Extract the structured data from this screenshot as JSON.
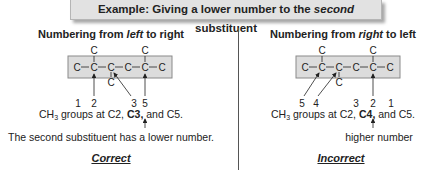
{
  "title": {
    "prefix": "Example: Giving a lower number to the ",
    "emphasis": "second",
    "suffix": " substituent"
  },
  "left": {
    "heading_prefix": "Numbering from ",
    "heading_emphasis": "left",
    "heading_suffix": " to right",
    "chain_atoms": [
      "C",
      "C",
      "C",
      "C",
      "C",
      "C"
    ],
    "substituents_top": [
      "C",
      "C"
    ],
    "substituent_bottom": "C",
    "numbers": [
      "1",
      "2",
      "3",
      "5"
    ],
    "groups_prefix": "CH",
    "groups_sub": "3",
    "groups_mid": " groups at C2, ",
    "groups_bold": "C3,",
    "groups_suffix": " and C5.",
    "note": "The second substituent has a lower number.",
    "verdict": "Correct"
  },
  "right": {
    "heading_prefix": "Numbering from ",
    "heading_emphasis": "right",
    "heading_suffix": " to left",
    "chain_atoms": [
      "C",
      "C",
      "C",
      "C",
      "C",
      "C"
    ],
    "substituents_top": [
      "C",
      "C"
    ],
    "substituent_bottom": "C",
    "numbers": [
      "5",
      "4",
      "3",
      "2",
      "1"
    ],
    "groups_prefix": "CH",
    "groups_sub": "3",
    "groups_mid": " groups at C2, ",
    "groups_bold": "C4,",
    "groups_suffix": " and C5.",
    "note": "higher number",
    "verdict": "Incorrect"
  },
  "colors": {
    "box_fill": "#dcdcdc",
    "box_border": "#8a8a8a",
    "title_fill": "#e2e2e2",
    "text": "#222222"
  }
}
